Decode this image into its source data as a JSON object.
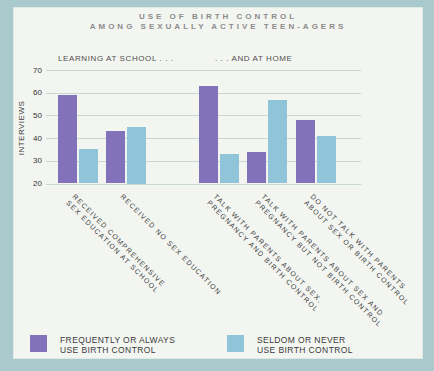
{
  "title": {
    "line1": "USE OF BIRTH CONTROL",
    "line2": "AMONG SEXUALLY ACTIVE TEEN-AGERS"
  },
  "section_labels": {
    "left": "LEARNING AT SCHOOL . . .",
    "right": ". . . AND AT HOME"
  },
  "chart_data": {
    "type": "bar",
    "title": "USE OF BIRTH CONTROL AMONG SEXUALLY ACTIVE TEEN-AGERS",
    "xlabel": "",
    "ylabel": "INTERVIEWS",
    "ylim": [
      20,
      70
    ],
    "yticks": [
      70,
      60,
      50,
      40,
      30,
      20
    ],
    "grid": true,
    "legend_position": "bottom",
    "sections": [
      {
        "label": "LEARNING AT SCHOOL . . .",
        "category_indexes": [
          0,
          1
        ]
      },
      {
        "label": ". . . AND AT HOME",
        "category_indexes": [
          2,
          3,
          4
        ]
      }
    ],
    "categories": [
      "RECEIVED COMPREHENSIVE SEX EDUCATION AT SCHOOL",
      "RECEIVED NO SEX EDUCATION",
      "TALK WITH PARENTS ABOUT SEX, PREGNANCY AND BIRTH CONTROL",
      "TALK WITH PARENTS ABOUT SEX AND PREGNANCY BUT NOT BIRTH CONTROL",
      "DO NOT TALK WITH PARENTS ABOUT SEX OR BIRTH CONTROL"
    ],
    "category_lines": [
      [
        "RECEIVED COMPREHENSIVE",
        "SEX EDUCATION AT SCHOOL"
      ],
      [
        "RECEIVED NO SEX EDUCATION"
      ],
      [
        "TALK WITH PARENTS ABOUT SEX,",
        "PREGNANCY AND BIRTH CONTROL"
      ],
      [
        "TALK WITH PARENTS ABOUT SEX AND",
        "PREGNANCY BUT NOT BIRTH CONTROL"
      ],
      [
        "DO NOT TALK WITH PARENTS",
        "ABOUT SEX OR BIRTH CONTROL"
      ]
    ],
    "series": [
      {
        "name": "FREQUENTLY OR ALWAYS USE BIRTH CONTROL",
        "color": "#8172b9",
        "values": [
          59,
          43,
          63,
          34,
          48
        ]
      },
      {
        "name": "SELDOM OR NEVER USE BIRTH CONTROL",
        "color": "#90c5d9",
        "values": [
          35,
          45,
          33,
          57,
          41
        ]
      }
    ]
  },
  "legend": {
    "items": [
      {
        "label_line1": "FREQUENTLY OR ALWAYS",
        "label_line2": "USE BIRTH CONTROL",
        "color": "#8172b9"
      },
      {
        "label_line1": "SELDOM OR NEVER",
        "label_line2": "USE BIRTH CONTROL",
        "color": "#90c5d9"
      }
    ]
  },
  "colors": {
    "frame": "#a8cacc",
    "panel": "#f3f5f1",
    "gridline": "#c9d6d4",
    "title_text": "#8c8c8c",
    "body_text": "#3c3c3c"
  }
}
